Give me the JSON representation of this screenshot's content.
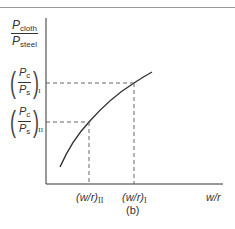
{
  "figure": {
    "caption": "(b)",
    "y_axis_label": {
      "numerator": "P",
      "numerator_sub": "cloth",
      "denominator": "P",
      "denominator_sub": "steel"
    },
    "x_axis_label": "w/r",
    "y_ticks": [
      {
        "numerator": "P",
        "numerator_sub": "c",
        "denominator": "P",
        "denominator_sub": "s",
        "roman": "I"
      },
      {
        "numerator": "P",
        "numerator_sub": "c",
        "denominator": "P",
        "denominator_sub": "s",
        "roman": "II"
      }
    ],
    "x_ticks": [
      {
        "label": "(w/r)",
        "roman": "II"
      },
      {
        "label": "(w/r)",
        "roman": "I"
      }
    ],
    "colors": {
      "line": "#333333",
      "dash": "#555555",
      "border": "#999999"
    }
  }
}
